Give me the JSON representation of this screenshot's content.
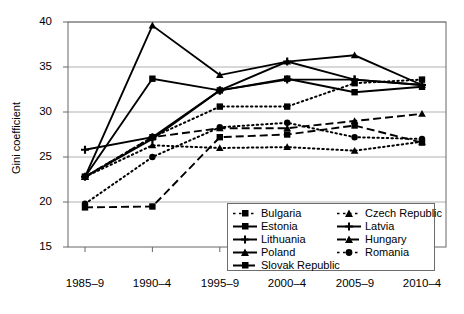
{
  "chart_data": {
    "type": "line",
    "title": "",
    "xlabel": "",
    "ylabel": "Gini coefficient",
    "categories": [
      "1985–9",
      "1990–4",
      "1995–9",
      "2000–4",
      "2005–9",
      "2010–4"
    ],
    "ylim": [
      15,
      40
    ],
    "yticks": [
      15,
      20,
      25,
      30,
      35,
      40
    ],
    "grid": true,
    "legend_position": "inside-bottom-right",
    "series": [
      {
        "name": "Bulgaria",
        "style": "dotted",
        "marker": "square",
        "values": [
          22.8,
          27.2,
          30.6,
          30.6,
          33.2,
          33.6
        ]
      },
      {
        "name": "Czech Republic",
        "style": "dotted",
        "marker": "triangle",
        "values": [
          22.8,
          26.3,
          26.0,
          26.1,
          25.7,
          26.7
        ]
      },
      {
        "name": "Estonia",
        "style": "solid",
        "marker": "square",
        "values": [
          22.8,
          33.7,
          32.4,
          33.7,
          32.2,
          32.8
        ]
      },
      {
        "name": "Latvia",
        "style": "solid",
        "marker": "plus",
        "values": [
          25.8,
          27.2,
          32.4,
          33.6,
          33.6,
          33.0
        ]
      },
      {
        "name": "Lithuania",
        "style": "solid",
        "marker": "plus",
        "values": [
          22.8,
          27.0,
          32.4,
          35.6,
          33.6,
          33.0
        ]
      },
      {
        "name": "Hungary",
        "style": "dashed",
        "marker": "triangle",
        "values": [
          22.8,
          27.2,
          28.2,
          28.2,
          29.0,
          29.8
        ]
      },
      {
        "name": "Poland",
        "style": "solid",
        "marker": "triangle",
        "values": [
          22.8,
          39.6,
          34.1,
          35.6,
          36.3,
          33.0
        ]
      },
      {
        "name": "Romania",
        "style": "dotted",
        "marker": "circle",
        "values": [
          19.8,
          25.0,
          28.3,
          28.8,
          27.2,
          27.0
        ]
      },
      {
        "name": "Slovak Republic",
        "style": "dashed",
        "marker": "square",
        "values": [
          19.4,
          19.5,
          27.2,
          27.5,
          28.5,
          26.6
        ]
      }
    ]
  },
  "axis": {
    "y_label": "Gini coefficient",
    "y_ticks": [
      "40",
      "35",
      "30",
      "25",
      "20",
      "15"
    ],
    "x_ticks": [
      "1985–9",
      "1990–4",
      "1995–9",
      "2000–4",
      "2005–9",
      "2010–4"
    ]
  },
  "legend": {
    "left_items": [
      {
        "label": "Bulgaria"
      },
      {
        "label": "Estonia"
      },
      {
        "label": "Lithuania"
      },
      {
        "label": "Poland"
      },
      {
        "label": "Slovak Republic"
      }
    ],
    "right_items": [
      {
        "label": "Czech Republic"
      },
      {
        "label": "Latvia"
      },
      {
        "label": "Hungary"
      },
      {
        "label": "Romania"
      }
    ]
  },
  "colors": {
    "line": "#000000",
    "grid": "#b0b0b0",
    "axis": "#666666",
    "background": "#ffffff"
  }
}
